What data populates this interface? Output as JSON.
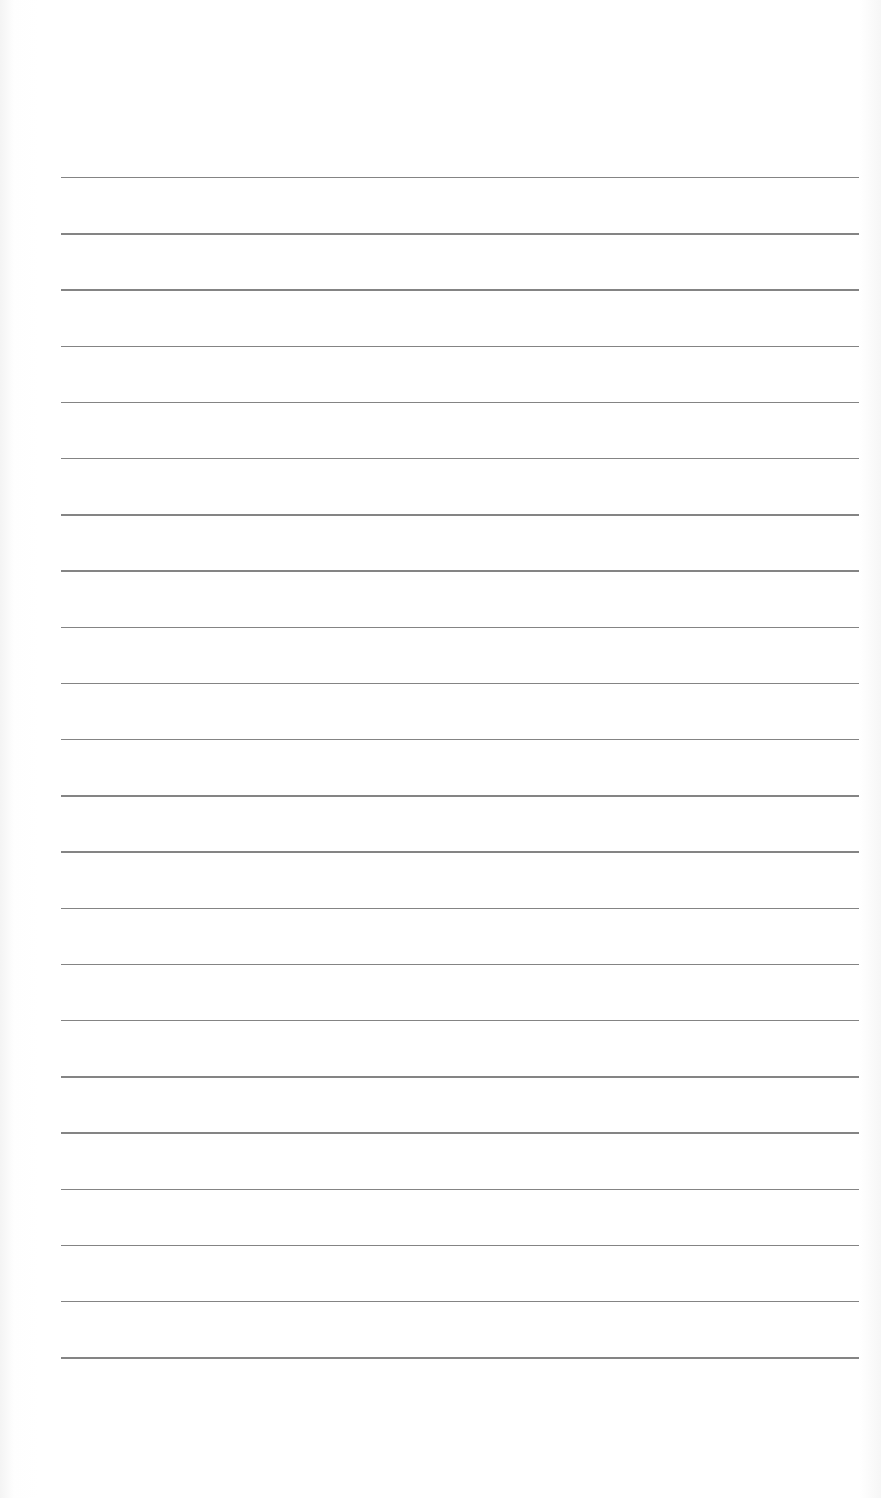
{
  "document": {
    "type": "lined-paper",
    "text": "",
    "line_count": 22,
    "line_color": "#6e6e6e",
    "background_color": "#ffffff",
    "lines": {
      "first_y": 177,
      "spacing": 56.2,
      "left_x": 61,
      "right_x": 859
    }
  }
}
